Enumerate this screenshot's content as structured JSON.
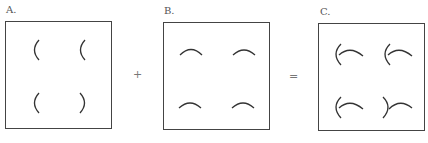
{
  "panels": [
    {
      "label": "A.",
      "description": "four left/right arcs (brackets)",
      "marks": [
        "(",
        "(",
        "(",
        ")"
      ]
    },
    {
      "label": "B.",
      "description": "four upward arcs",
      "marks": [
        "arc-up",
        "arc-up",
        "arc-up",
        "arc-up"
      ]
    },
    {
      "label": "C.",
      "description": "combination of A and B",
      "marks": [
        "(+arc",
        "(+arc",
        "(+arc",
        ")+arc"
      ]
    }
  ],
  "operators": {
    "plus": "+",
    "equals": "="
  },
  "colors": {
    "stroke": "#333333",
    "border": "#444444"
  }
}
